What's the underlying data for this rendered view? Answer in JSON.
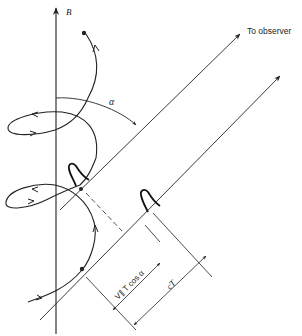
{
  "diagram": {
    "type": "physics-schematic",
    "labels": {
      "field_axis": "B",
      "observer_direction": "To observer",
      "angle": "α",
      "short_dimension": "V∥ T cos α",
      "long_dimension": "cT"
    },
    "elements": {
      "axis": "vertical magnetic field line with arrow pointing up",
      "helix": "spiral trajectory with direction arrows, two loops, starting dot bottom and ending dot top",
      "sight_lines": 2,
      "pulses": 2,
      "dashed_projection": 1,
      "dimension_lines": 2
    },
    "colors": {
      "ink": "#222222",
      "background": "#ffffff"
    }
  }
}
